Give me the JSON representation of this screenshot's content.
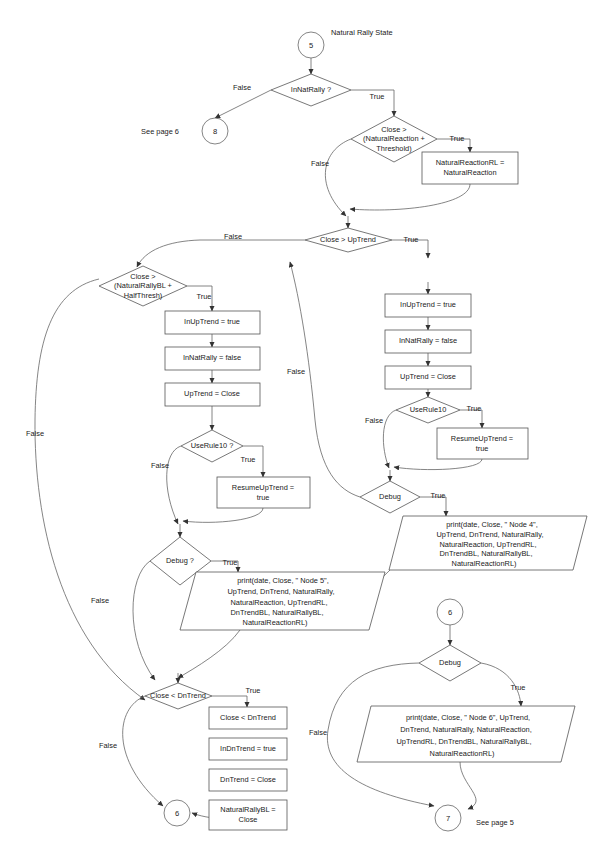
{
  "diagram": {
    "title": "Natural Rally State",
    "page_notes": {
      "see_page_6": "See page 6",
      "see_page_5": "See page 5"
    },
    "connectors": {
      "start": "5",
      "to_page6": "8",
      "mid_entry": "6",
      "exit_left": "6",
      "exit_right": "7"
    },
    "labels": {
      "true": "True",
      "false": "False"
    },
    "decisions": {
      "in_nat_rally": "InNatRally ?",
      "close_gt_natreaction": "Close >\n(NaturalReaction +\nThreshold)",
      "close_gt_uptrend": "Close > UpTrend",
      "close_gt_natrallybl": "Close >\n(NaturalRallyBL +\nHalfThresh)",
      "use_rule10_left": "UseRule10 ?",
      "use_rule10_right": "UseRule10",
      "debug_left": "Debug ?",
      "debug_right": "Debug",
      "debug_node6": "Debug",
      "close_lt_dntrend": "Close < DnTrend"
    },
    "processes": {
      "natural_reaction_rl": "NaturalReactionRL =\nNaturalReaction",
      "left_in_uptrend_true": "InUpTrend = true",
      "left_in_natrally_false": "InNatRally = false",
      "left_uptrend_close": "UpTrend = Close",
      "left_resume_uptrend": "ResumeUpTrend =\ntrue",
      "right_in_uptrend_true": "InUpTrend = true",
      "right_in_natrally_false": "InNatRally = false",
      "right_uptrend_close": "UpTrend = Close",
      "right_resume_uptrend": "ResumeUpTrend =\ntrue",
      "dn_close_lt_dntrend": "Close < DnTrend",
      "dn_in_dntrend_true": "InDnTrend = true",
      "dn_dntrend_close": "DnTrend = Close",
      "dn_natural_rally_bl": "NaturalRallyBL =\nClose"
    },
    "io_blocks": {
      "node4_print": "print(date, Close, \" Node 4\",\nUpTrend, DnTrend, NaturalRally,\nNaturalReaction, UpTrendRL,\nDnTrendBL, NaturalRallyBL,\nNaturalReactionRL)",
      "node5_print": "print(date, Close, \" Node 5\",\nUpTrend, DnTrend, NaturalRally,\nNaturalReaction, UpTrendRL,\nDnTrendBL, NaturalRallyBL,\nNaturalReactionRL)",
      "node6_print": "print(date, Close, \" Node 6\", UpTrend,\nDnTrend, NaturalRally, NaturalReaction,\nUpTrendRL, DnTrendBL, NaturalRallyBL,\nNaturalReactionRL)"
    },
    "colors": {
      "stroke": "#666666",
      "shape_stroke": "#555555",
      "text": "#1a1a1a",
      "background": "#ffffff"
    }
  }
}
